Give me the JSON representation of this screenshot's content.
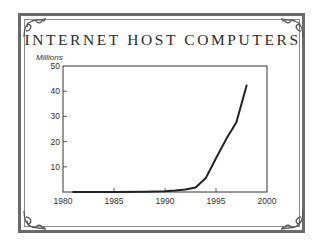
{
  "title": "INTERNET HOST COMPUTERS",
  "y_unit_label": "Millions",
  "colors": {
    "border": "#6b6b6b",
    "line": "#222222",
    "text": "#2b2b2b"
  },
  "chart_data": {
    "type": "line",
    "title": "INTERNET HOST COMPUTERS",
    "xlabel": "",
    "ylabel": "Millions",
    "xlim": [
      1980,
      2000
    ],
    "ylim": [
      0,
      50
    ],
    "x_ticks": [
      1980,
      1985,
      1990,
      1995,
      2000
    ],
    "y_ticks": [
      10,
      20,
      30,
      40,
      50
    ],
    "grid": false,
    "legend": null,
    "series": [
      {
        "name": "Internet host computers (millions)",
        "x": [
          1981,
          1985,
          1988,
          1990,
          1991,
          1992,
          1993,
          1994,
          1995,
          1996,
          1997,
          1998
        ],
        "values": [
          0.0,
          0.0,
          0.1,
          0.3,
          0.6,
          1.0,
          1.8,
          5.5,
          13.4,
          21.0,
          27.7,
          42.3
        ]
      }
    ]
  }
}
